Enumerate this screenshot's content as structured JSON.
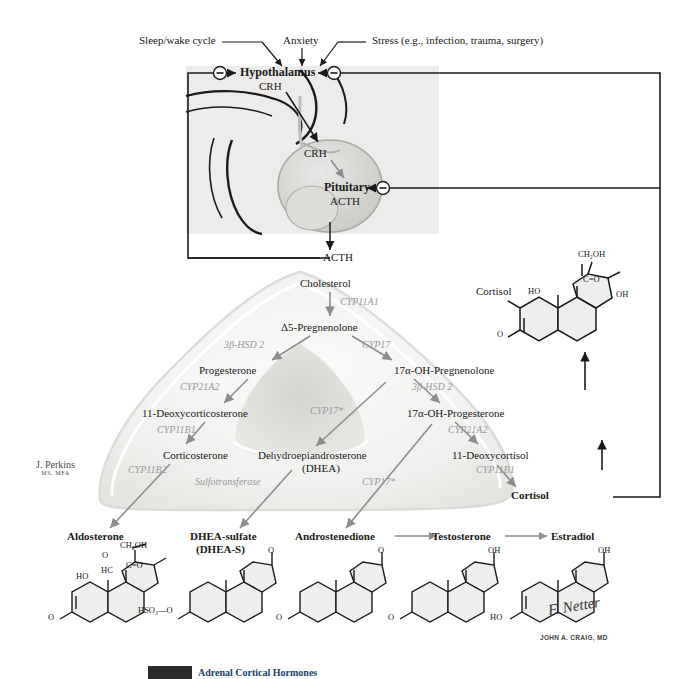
{
  "figure": {
    "artist_credit": {
      "name": "J. Perkins",
      "degrees": "MS, MFA"
    },
    "signatures": [
      "F. Netter",
      "JOHN A. CRAIG, MD"
    ],
    "caption_visible_fragment": "Adrenal Cortical Hormones"
  },
  "inputs": [
    {
      "id": "sleep-wake",
      "label": "Sleep/wake cycle"
    },
    {
      "id": "anxiety",
      "label": "Anxiety"
    },
    {
      "id": "stress",
      "label": "Stress (e.g., infection, trauma, surgery)"
    }
  ],
  "axis": {
    "hypothalamus": {
      "name": "Hypothalamus",
      "hormone": "CRH"
    },
    "portal_hormone": "CRH",
    "pituitary": {
      "name": "Pituitary",
      "hormone": "ACTH"
    },
    "circulating": "ACTH",
    "feedback_symbol": "−",
    "feedback_note": "negative feedback"
  },
  "pathway": {
    "precursor": "Cholesterol",
    "nodes": [
      {
        "id": "cholesterol",
        "label": "Cholesterol"
      },
      {
        "id": "pregnenolone",
        "label": "Δ5-Pregnenolone"
      },
      {
        "id": "progesterone",
        "label": "Progesterone"
      },
      {
        "id": "oh-pregnenolone",
        "label": "17α-OH-Pregnenolone"
      },
      {
        "id": "deoxycorticosterone",
        "label": "11-Deoxycorticosterone"
      },
      {
        "id": "oh-progesterone",
        "label": "17α-OH-Progesterone"
      },
      {
        "id": "corticosterone",
        "label": "Corticosterone"
      },
      {
        "id": "dhea",
        "label": "Dehydroepiandrosterone"
      },
      {
        "id": "dhea-paren",
        "label": "(DHEA)"
      },
      {
        "id": "deoxycortisol",
        "label": "11-Deoxycortisol"
      },
      {
        "id": "cortisol-node",
        "label": "Cortisol"
      }
    ],
    "enzymes": [
      {
        "id": "e-cyp11a1",
        "label": "CYP11A1"
      },
      {
        "id": "e-3bhsd2-left",
        "label": "3β-HSD 2"
      },
      {
        "id": "e-cyp17",
        "label": "CYP17"
      },
      {
        "id": "e-cyp21a2-left",
        "label": "CYP21A2"
      },
      {
        "id": "e-3bhsd2-right",
        "label": "3β-HSD 2"
      },
      {
        "id": "e-cyp11b1-left",
        "label": "CYP11B1"
      },
      {
        "id": "e-cyp17-star-mid",
        "label": "CYP17*"
      },
      {
        "id": "e-cyp21a2-right",
        "label": "CYP21A2"
      },
      {
        "id": "e-cyp11b2",
        "label": "CYP11B2"
      },
      {
        "id": "e-sulfotransferase",
        "label": "Sulfotransferase"
      },
      {
        "id": "e-cyp17-star-low",
        "label": "CYP17*"
      },
      {
        "id": "e-cyp11b1-right",
        "label": "CYP11B1"
      }
    ]
  },
  "products": [
    {
      "id": "aldosterone",
      "label": "Aldosterone",
      "sublabel": ""
    },
    {
      "id": "dhea-sulfate",
      "label": "DHEA-sulfate",
      "sublabel": "(DHEA-S)"
    },
    {
      "id": "androstenedione",
      "label": "Androstenedione",
      "sublabel": ""
    },
    {
      "id": "testosterone",
      "label": "Testosterone",
      "sublabel": ""
    },
    {
      "id": "estradiol",
      "label": "Estradiol",
      "sublabel": ""
    }
  ],
  "cortisol_structure": {
    "name": "Cortisol",
    "atoms": [
      "CH₂OH",
      "C=O",
      "OH",
      "HO",
      "O"
    ]
  },
  "structure_atoms": {
    "aldosterone": [
      "CH₂OH",
      "C=O",
      "O",
      "HC",
      "HO",
      "O"
    ],
    "dhea_sulfate": [
      "O",
      "HSO₃—O"
    ],
    "androstenedione": [
      "O",
      "O"
    ],
    "testosterone": [
      "OH",
      "O"
    ],
    "estradiol": [
      "OH",
      "HO"
    ]
  },
  "colors": {
    "ink": "#1a1a1a",
    "enzyme_gray": "#9a9a9a",
    "arrow_gray": "#8d8d8d",
    "gland_fill": "#f1f1ef",
    "medulla_fill": "#d8d8d6",
    "inset_bg": "#ececeb",
    "ring_fill": "#e9e9e7",
    "caption_blue": "#1b3f6b"
  }
}
